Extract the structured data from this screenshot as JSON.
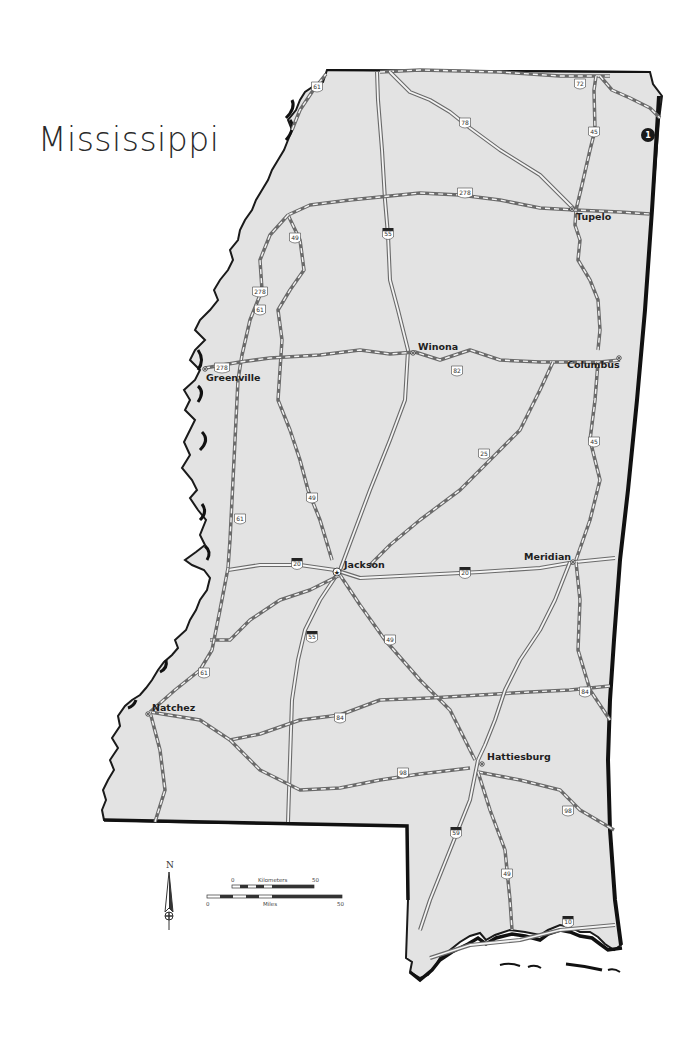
{
  "title": "Mississippi",
  "colors": {
    "land": "#e3e3e3",
    "border": "#1a1a1a",
    "us_route": "#5a5a5a",
    "interstate": "#6a6a6a",
    "background": "#ffffff"
  },
  "badge": {
    "label": "1",
    "icon": "numbered-marker-icon"
  },
  "cities": [
    {
      "id": "tupelo",
      "name": "Tupelo",
      "capital": false
    },
    {
      "id": "greenville",
      "name": "Greenville",
      "capital": false
    },
    {
      "id": "winona",
      "name": "Winona",
      "capital": false
    },
    {
      "id": "columbus",
      "name": "Columbus",
      "capital": false
    },
    {
      "id": "jackson",
      "name": "Jackson",
      "capital": true
    },
    {
      "id": "meridian",
      "name": "Meridian",
      "capital": false
    },
    {
      "id": "natchez",
      "name": "Natchez",
      "capital": false
    },
    {
      "id": "hattiesburg",
      "name": "Hattiesburg",
      "capital": false
    }
  ],
  "shields": [
    {
      "type": "us",
      "number": "61"
    },
    {
      "type": "us",
      "number": "72"
    },
    {
      "type": "us",
      "number": "78"
    },
    {
      "type": "us",
      "number": "45"
    },
    {
      "type": "us",
      "number": "278"
    },
    {
      "type": "interstate",
      "number": "55"
    },
    {
      "type": "us",
      "number": "49"
    },
    {
      "type": "us",
      "number": "278"
    },
    {
      "type": "us",
      "number": "61"
    },
    {
      "type": "us",
      "number": "278"
    },
    {
      "type": "us",
      "number": "82"
    },
    {
      "type": "us",
      "number": "25"
    },
    {
      "type": "us",
      "number": "45"
    },
    {
      "type": "us",
      "number": "49"
    },
    {
      "type": "us",
      "number": "61"
    },
    {
      "type": "interstate",
      "number": "20"
    },
    {
      "type": "interstate",
      "number": "20"
    },
    {
      "type": "interstate",
      "number": "55"
    },
    {
      "type": "us",
      "number": "49"
    },
    {
      "type": "us",
      "number": "61"
    },
    {
      "type": "us",
      "number": "84"
    },
    {
      "type": "us",
      "number": "84"
    },
    {
      "type": "us",
      "number": "98"
    },
    {
      "type": "us",
      "number": "98"
    },
    {
      "type": "interstate",
      "number": "59"
    },
    {
      "type": "us",
      "number": "49"
    },
    {
      "type": "interstate",
      "number": "10"
    }
  ],
  "legend": {
    "north_label": "N",
    "kilometers_label": "Kilometers",
    "miles_label": "Miles",
    "km_start": "0",
    "km_end": "50",
    "mi_start": "0",
    "mi_end": "50"
  }
}
